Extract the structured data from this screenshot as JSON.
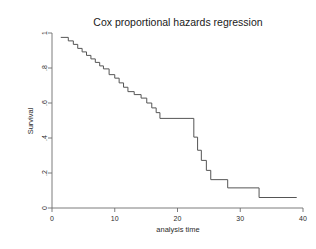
{
  "figure": {
    "title": "Cox proportional hazards regression",
    "background_color": "#ffffff",
    "line_color": "#555555",
    "axis_color": "#6e6e6e"
  },
  "chart_data": {
    "type": "line",
    "subtype": "step-survival-curve",
    "title": "Cox proportional hazards regression",
    "xlabel": "analysis time",
    "ylabel": "Survival",
    "xlim": [
      0,
      40
    ],
    "ylim": [
      0,
      1
    ],
    "xticks": [
      0,
      10,
      20,
      30,
      40
    ],
    "xticklabels": [
      "0",
      "10",
      "20",
      "30",
      "40"
    ],
    "yticks": [
      0,
      0.2,
      0.4,
      0.6,
      0.8,
      1
    ],
    "yticklabels": [
      "0",
      ".2",
      ".4",
      ".6",
      ".8",
      "1"
    ],
    "grid": false,
    "legend": false,
    "series": [
      {
        "name": "Survival",
        "step": "post",
        "x": [
          1.4,
          2.6,
          3.4,
          4.1,
          4.8,
          5.5,
          6.2,
          6.9,
          7.6,
          8.2,
          9.1,
          10.0,
          10.7,
          11.4,
          12.1,
          13.1,
          14.2,
          15.1,
          15.9,
          16.6,
          17.2,
          22.0,
          22.6,
          23.2,
          23.8,
          24.6,
          25.3,
          28.0,
          33.0,
          39.0
        ],
        "y": [
          0.975,
          0.955,
          0.935,
          0.912,
          0.892,
          0.872,
          0.852,
          0.832,
          0.812,
          0.795,
          0.762,
          0.742,
          0.715,
          0.69,
          0.665,
          0.648,
          0.628,
          0.6,
          0.572,
          0.545,
          0.512,
          0.512,
          0.405,
          0.33,
          0.272,
          0.215,
          0.162,
          0.115,
          0.06,
          0.06
        ]
      }
    ],
    "annotations": []
  }
}
